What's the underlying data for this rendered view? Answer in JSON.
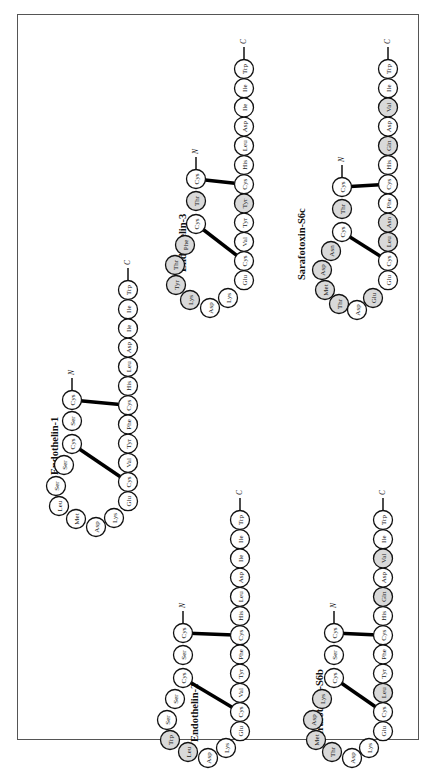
{
  "figure": {
    "orientation": "rotated-90-ccw",
    "colors": {
      "plain_residue": "#ffffff",
      "shaded_residue": "#d9d9d9",
      "bond": "#000000"
    },
    "peptides": [
      {
        "name": "Endothelin-1",
        "n_label": "N",
        "c_label": "C",
        "residues": [
          {
            "aa": "Cys",
            "shaded": false
          },
          {
            "aa": "Ser",
            "shaded": false
          },
          {
            "aa": "Cys",
            "shaded": false
          },
          {
            "aa": "Ser",
            "shaded": false
          },
          {
            "aa": "Ser",
            "shaded": false
          },
          {
            "aa": "Leu",
            "shaded": false
          },
          {
            "aa": "Met",
            "shaded": false
          },
          {
            "aa": "Asp",
            "shaded": false
          },
          {
            "aa": "Lys",
            "shaded": false
          },
          {
            "aa": "Glu",
            "shaded": false
          },
          {
            "aa": "Cys",
            "shaded": false
          },
          {
            "aa": "Val",
            "shaded": false
          },
          {
            "aa": "Tyr",
            "shaded": false
          },
          {
            "aa": "Phe",
            "shaded": false
          },
          {
            "aa": "Cys",
            "shaded": false
          },
          {
            "aa": "His",
            "shaded": false
          },
          {
            "aa": "Leu",
            "shaded": false
          },
          {
            "aa": "Asp",
            "shaded": false
          },
          {
            "aa": "Ile",
            "shaded": false
          },
          {
            "aa": "Ile",
            "shaded": false
          },
          {
            "aa": "Trp",
            "shaded": false
          }
        ],
        "disulfide_bonds": [
          [
            1,
            15
          ],
          [
            3,
            11
          ]
        ]
      },
      {
        "name": "Endothelin-2",
        "n_label": "N",
        "c_label": "C",
        "residues": [
          {
            "aa": "Cys",
            "shaded": false
          },
          {
            "aa": "Ser",
            "shaded": false
          },
          {
            "aa": "Cys",
            "shaded": false
          },
          {
            "aa": "Ser",
            "shaded": false
          },
          {
            "aa": "Ser",
            "shaded": false
          },
          {
            "aa": "Trp",
            "shaded": true
          },
          {
            "aa": "Leu",
            "shaded": true
          },
          {
            "aa": "Asp",
            "shaded": false
          },
          {
            "aa": "Lys",
            "shaded": false
          },
          {
            "aa": "Glu",
            "shaded": false
          },
          {
            "aa": "Cys",
            "shaded": false
          },
          {
            "aa": "Val",
            "shaded": false
          },
          {
            "aa": "Tyr",
            "shaded": false
          },
          {
            "aa": "Phe",
            "shaded": false
          },
          {
            "aa": "Cys",
            "shaded": false
          },
          {
            "aa": "His",
            "shaded": false
          },
          {
            "aa": "Leu",
            "shaded": false
          },
          {
            "aa": "Asp",
            "shaded": false
          },
          {
            "aa": "Ile",
            "shaded": false
          },
          {
            "aa": "Ile",
            "shaded": false
          },
          {
            "aa": "Trp",
            "shaded": false
          }
        ],
        "disulfide_bonds": [
          [
            1,
            15
          ],
          [
            3,
            11
          ]
        ]
      },
      {
        "name": "Endothelin-3",
        "n_label": "N",
        "c_label": "C",
        "residues": [
          {
            "aa": "Cys",
            "shaded": false
          },
          {
            "aa": "Thr",
            "shaded": true
          },
          {
            "aa": "Cys",
            "shaded": false
          },
          {
            "aa": "Phe",
            "shaded": true
          },
          {
            "aa": "Thr",
            "shaded": true
          },
          {
            "aa": "Tyr",
            "shaded": true
          },
          {
            "aa": "Lys",
            "shaded": true
          },
          {
            "aa": "Asp",
            "shaded": false
          },
          {
            "aa": "Lys",
            "shaded": false
          },
          {
            "aa": "Glu",
            "shaded": false
          },
          {
            "aa": "Cys",
            "shaded": false
          },
          {
            "aa": "Val",
            "shaded": false
          },
          {
            "aa": "Tyr",
            "shaded": false
          },
          {
            "aa": "Tyr",
            "shaded": true
          },
          {
            "aa": "Cys",
            "shaded": false
          },
          {
            "aa": "His",
            "shaded": false
          },
          {
            "aa": "Leu",
            "shaded": false
          },
          {
            "aa": "Asp",
            "shaded": false
          },
          {
            "aa": "Ile",
            "shaded": false
          },
          {
            "aa": "Ile",
            "shaded": false
          },
          {
            "aa": "Trp",
            "shaded": false
          }
        ],
        "disulfide_bonds": [
          [
            1,
            15
          ],
          [
            3,
            11
          ]
        ]
      },
      {
        "name": "Sarafotoxin-S6b",
        "n_label": "N",
        "c_label": "C",
        "residues": [
          {
            "aa": "Cys",
            "shaded": false
          },
          {
            "aa": "Ser",
            "shaded": false
          },
          {
            "aa": "Cys",
            "shaded": false
          },
          {
            "aa": "Lys",
            "shaded": true
          },
          {
            "aa": "Asp",
            "shaded": true
          },
          {
            "aa": "Met",
            "shaded": true
          },
          {
            "aa": "Thr",
            "shaded": true
          },
          {
            "aa": "Asp",
            "shaded": false
          },
          {
            "aa": "Lys",
            "shaded": false
          },
          {
            "aa": "Glu",
            "shaded": false
          },
          {
            "aa": "Cys",
            "shaded": false
          },
          {
            "aa": "Leu",
            "shaded": true
          },
          {
            "aa": "Tyr",
            "shaded": false
          },
          {
            "aa": "Phe",
            "shaded": false
          },
          {
            "aa": "Cys",
            "shaded": false
          },
          {
            "aa": "His",
            "shaded": false
          },
          {
            "aa": "Gln",
            "shaded": true
          },
          {
            "aa": "Asp",
            "shaded": false
          },
          {
            "aa": "Val",
            "shaded": true
          },
          {
            "aa": "Ile",
            "shaded": false
          },
          {
            "aa": "Trp",
            "shaded": false
          }
        ],
        "disulfide_bonds": [
          [
            1,
            15
          ],
          [
            3,
            11
          ]
        ]
      },
      {
        "name": "Sarafotoxin-S6c",
        "n_label": "N",
        "c_label": "C",
        "residues": [
          {
            "aa": "Cys",
            "shaded": false
          },
          {
            "aa": "Thr",
            "shaded": true
          },
          {
            "aa": "Cys",
            "shaded": false
          },
          {
            "aa": "Asn",
            "shaded": true
          },
          {
            "aa": "Asp",
            "shaded": true
          },
          {
            "aa": "Met",
            "shaded": true
          },
          {
            "aa": "Thr",
            "shaded": true
          },
          {
            "aa": "Asp",
            "shaded": false
          },
          {
            "aa": "Glu",
            "shaded": true
          },
          {
            "aa": "Glu",
            "shaded": false
          },
          {
            "aa": "Cys",
            "shaded": false
          },
          {
            "aa": "Leu",
            "shaded": true
          },
          {
            "aa": "Asn",
            "shaded": true
          },
          {
            "aa": "Phe",
            "shaded": false
          },
          {
            "aa": "Cys",
            "shaded": false
          },
          {
            "aa": "His",
            "shaded": false
          },
          {
            "aa": "Gln",
            "shaded": true
          },
          {
            "aa": "Asp",
            "shaded": false
          },
          {
            "aa": "Val",
            "shaded": true
          },
          {
            "aa": "Ile",
            "shaded": false
          },
          {
            "aa": "Trp",
            "shaded": false
          }
        ],
        "disulfide_bonds": [
          [
            1,
            15
          ],
          [
            3,
            11
          ]
        ]
      }
    ]
  }
}
